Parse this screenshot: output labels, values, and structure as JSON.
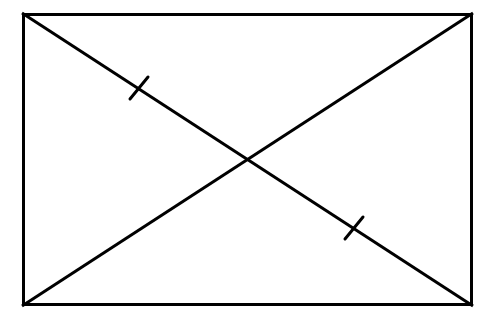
{
  "figure": {
    "background_color": "#ffffff",
    "stroke_color": "#000000",
    "canvas": {
      "width": 484,
      "height": 319
    }
  },
  "rectangle": {
    "label": "rectangle-outline",
    "x": 22,
    "y": 13,
    "width": 451,
    "height": 293,
    "stroke_width": 3,
    "corners": {
      "top_left": [
        22,
        13
      ],
      "top_right": [
        473,
        13
      ],
      "bottom_right": [
        473,
        306
      ],
      "bottom_left": [
        22,
        306
      ]
    }
  },
  "diagonals": [
    {
      "label": "diagonal-top-left-to-bottom-right",
      "x1": 22,
      "y1": 13,
      "x2": 473,
      "y2": 306,
      "stroke_width": 3
    },
    {
      "label": "diagonal-bottom-left-to-top-right",
      "x1": 22,
      "y1": 306,
      "x2": 473,
      "y2": 13,
      "stroke_width": 3
    }
  ],
  "intersection": {
    "label": "diagonals-intersection",
    "x": 248,
    "y": 160
  },
  "tick_marks": [
    {
      "label": "tick-mark-upper-left",
      "center_x": 139,
      "center_y": 88,
      "x1": 130,
      "y1": 99,
      "x2": 148,
      "y2": 77,
      "stroke_width": 3
    },
    {
      "label": "tick-mark-lower-right",
      "center_x": 354,
      "center_y": 228,
      "x1": 345,
      "y1": 239,
      "x2": 363,
      "y2": 217,
      "stroke_width": 3
    }
  ]
}
